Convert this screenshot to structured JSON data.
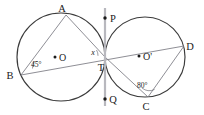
{
  "figure": {
    "kind": "geometry-diagram",
    "background_color": "#ffffff",
    "circle_stroke_color": "#3b3b3b",
    "chord_stroke_color": "#7a7a82",
    "tangent_stroke_color": "#b8b8be",
    "label_color": "#1a1a1a"
  },
  "circles": [
    {
      "name": "left-circle",
      "center_label": "O",
      "cx": 61,
      "cy": 57,
      "r": 44
    },
    {
      "name": "right-circle",
      "center_label": "O'",
      "cx": 145,
      "cy": 57,
      "r": 40
    }
  ],
  "points": {
    "A": {
      "label": "A",
      "x": 66,
      "y": 15,
      "label_x": 62,
      "label_y": 12
    },
    "B": {
      "label": "B",
      "x": 21,
      "y": 75,
      "label_x": 10,
      "label_y": 79
    },
    "T": {
      "label": "T",
      "x": 105,
      "y": 57,
      "label_x": 99,
      "label_y": 70
    },
    "D": {
      "label": "D",
      "x": 184,
      "y": 46,
      "label_x": 188,
      "label_y": 49
    },
    "C": {
      "label": "C",
      "x": 148,
      "y": 97,
      "label_x": 144,
      "label_y": 110
    },
    "P": {
      "label": "P",
      "x": 105,
      "y": 18,
      "label_x": 110,
      "label_y": 21
    },
    "Q": {
      "label": "Q",
      "x": 105,
      "y": 99,
      "label_x": 110,
      "label_y": 102
    }
  },
  "segments": [
    {
      "name": "segment-AB",
      "from": "A",
      "to": "B"
    },
    {
      "name": "segment-AT",
      "from": "A",
      "to": "T"
    },
    {
      "name": "segment-BD",
      "from": "B",
      "to": "D"
    },
    {
      "name": "segment-TC",
      "from": "T",
      "to": "C"
    },
    {
      "name": "segment-CD",
      "from": "C",
      "to": "D"
    }
  ],
  "tangent": {
    "name": "tangent-line-PQ",
    "x": 105,
    "y_top": 8,
    "y_bottom": 106,
    "endpoint_top_label": "P",
    "endpoint_bottom_label": "Q"
  },
  "angles": [
    {
      "name": "angle-at-B",
      "vertex": "B",
      "value": "45°",
      "label_x": 31,
      "label_y": 66
    },
    {
      "name": "angle-at-C",
      "vertex": "C",
      "value": "80°",
      "label_x": 137,
      "label_y": 89
    },
    {
      "name": "angle-unknown-at-T",
      "vertex": "T",
      "value": "x",
      "label_x": 92,
      "label_y": 55
    }
  ],
  "labels": {
    "A": "A",
    "B": "B",
    "C": "C",
    "D": "D",
    "T": "T",
    "P": "P",
    "Q": "Q",
    "O": "O",
    "O_prime": "O'",
    "angle_B": "45°",
    "angle_C": "80°",
    "angle_x": "x"
  }
}
